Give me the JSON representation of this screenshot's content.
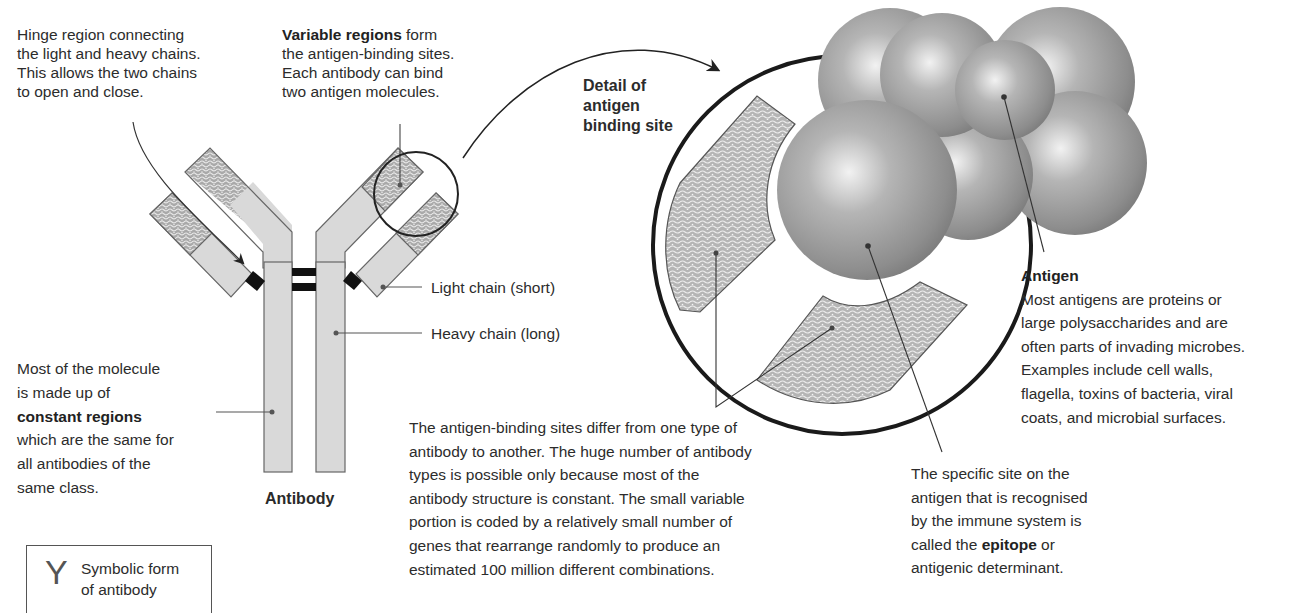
{
  "diagram": {
    "labels": {
      "hinge": {
        "lines": [
          "Hinge region connecting",
          "the light and heavy chains.",
          "This allows the two chains",
          "to open and close."
        ]
      },
      "variable": {
        "bold": "Variable regions",
        "first_rest": " form",
        "lines": [
          "the antigen-binding sites.",
          "Each antibody can bind",
          "two antigen molecules."
        ]
      },
      "detail": {
        "lines": [
          "Detail of",
          "antigen",
          "binding site"
        ]
      },
      "light_chain": "Light chain (short)",
      "heavy_chain": "Heavy chain (long)",
      "constant": {
        "lines_before": [
          "Most of the molecule",
          "is made up of"
        ],
        "bold": "constant regions",
        "lines_after": [
          "which are the same for",
          "all antibodies of the",
          "same class."
        ]
      },
      "antibody_caption": "Antibody",
      "binding_sites": {
        "lines": [
          "The antigen-binding sites differ from one type of",
          "antibody to another. The huge number of antibody",
          "types is possible only because most of the",
          "antibody structure is constant. The small variable",
          "portion is coded by a relatively small number of",
          "genes that rearrange randomly to produce an",
          "estimated 100 million different combinations."
        ]
      },
      "epitope": {
        "lines": [
          "The specific site on the",
          "antigen that is recognised",
          "by the immune system is"
        ],
        "last_before": "called the ",
        "bold": "epitope",
        "last_after": " or",
        "final": "antigenic determinant."
      },
      "antigen": {
        "bold": "Antigen",
        "lines": [
          "Most antigens are proteins or",
          "large polysaccharides and are",
          "often parts of invading microbes.",
          "Examples include cell walls,",
          "flagella, toxins of bacteria, viral",
          "coats, and microbial surfaces."
        ]
      },
      "symbolic": {
        "glyph": "Y",
        "lines": [
          "Symbolic form",
          "of antibody"
        ]
      }
    },
    "colors": {
      "chain_fill": "#d9d9d9",
      "variable_fill": "#b8b8b8",
      "outline": "#666666",
      "bond": "#111111",
      "sphere_base": "#9a9a9a",
      "circle_stroke": "#1a1a1a"
    }
  }
}
